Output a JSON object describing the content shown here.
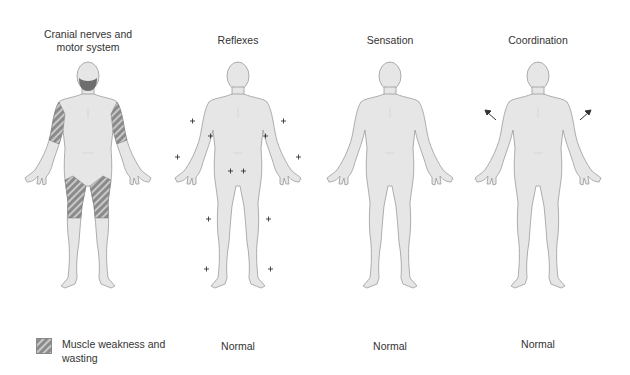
{
  "panels": [
    {
      "title": "Cranial nerves and motor system",
      "title_line1": "Cranial nerves and",
      "title_line2": "motor system",
      "status": "",
      "markers": "muscle-wasting"
    },
    {
      "title": "Reflexes",
      "status": "Normal",
      "markers": "plus-signs-and-plantar-arrows"
    },
    {
      "title": "Sensation",
      "status": "Normal",
      "markers": "none"
    },
    {
      "title": "Coordination",
      "status": "Normal",
      "markers": "outward-arm-arrows-and-gait-arrow"
    }
  ],
  "legend": {
    "label": "Muscle weakness and wasting",
    "swatch": "hatched-grey"
  },
  "colors": {
    "skin": "#e6e6e6",
    "outline": "#9a9a9a",
    "wasting": "#7a7a7a",
    "text": "#333333"
  }
}
